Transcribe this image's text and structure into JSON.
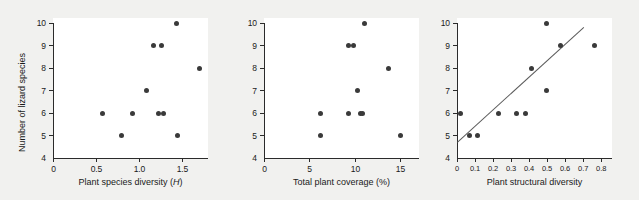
{
  "figure": {
    "background_color": "#f1f1ef",
    "panel_background_color": "#ffffff",
    "axis_color": "#2b2b2b",
    "point_color": "#3a3a3a",
    "line_color": "#5a5a5a",
    "shared_ylabel": "Number of lizard species"
  },
  "chart_data": [
    {
      "type": "scatter",
      "panel": 1,
      "title": "",
      "xlabel": "Plant species diversity (H)",
      "xlabel_italic_part": "H",
      "ylabel": "Number of lizard species",
      "xlim": [
        0,
        1.8
      ],
      "ylim": [
        4,
        10.3
      ],
      "grid": false,
      "legend": null,
      "xticks": [
        0,
        0.5,
        1.0,
        1.5
      ],
      "xticklabels": [
        "0",
        "0.5",
        "1.0",
        "1.5"
      ],
      "yticks": [
        4,
        5,
        6,
        7,
        8,
        9,
        10
      ],
      "yticklabels": [
        "4",
        "5",
        "6",
        "7",
        "8",
        "9",
        "10"
      ],
      "x": [
        0.58,
        0.8,
        0.92,
        1.09,
        1.17,
        1.22,
        1.26,
        1.28,
        1.43,
        1.45,
        1.7
      ],
      "y": [
        6,
        5,
        6,
        7,
        9,
        6,
        9,
        6,
        10,
        5,
        8
      ],
      "n_points": 11
    },
    {
      "type": "scatter",
      "panel": 2,
      "title": "",
      "xlabel": "Total plant coverage (%)",
      "ylabel": "Number of lizard species",
      "xlim": [
        0,
        17
      ],
      "ylim": [
        4,
        10.3
      ],
      "grid": false,
      "legend": null,
      "xticks": [
        0,
        5,
        10,
        15
      ],
      "xticklabels": [
        "0",
        "5",
        "10",
        "15"
      ],
      "yticks": [
        4,
        5,
        6,
        7,
        8,
        9,
        10
      ],
      "yticklabels": [
        "4",
        "5",
        "6",
        "7",
        "8",
        "9",
        "10"
      ],
      "x": [
        6.2,
        6.2,
        9.3,
        9.3,
        9.8,
        10.2,
        10.6,
        10.8,
        11.0,
        13.7,
        15.0
      ],
      "y": [
        6,
        5,
        9,
        6,
        9,
        7,
        6,
        6,
        10,
        8,
        5
      ],
      "n_points": 11
    },
    {
      "type": "scatter",
      "panel": 3,
      "title": "",
      "xlabel": "Plant structural diversity",
      "ylabel": "Number of lizard species",
      "xlim": [
        0,
        0.86
      ],
      "ylim": [
        4,
        10.3
      ],
      "grid": false,
      "legend": null,
      "xticks": [
        0,
        0.1,
        0.2,
        0.3,
        0.4,
        0.5,
        0.6,
        0.7,
        0.8
      ],
      "xticklabels": [
        "0",
        "0.1",
        "0.2",
        "0.3",
        "0.4",
        "0.5",
        "0.6",
        "0.7",
        "0.8"
      ],
      "yticks": [
        4,
        5,
        6,
        7,
        8,
        9,
        10
      ],
      "yticklabels": [
        "4",
        "5",
        "6",
        "7",
        "8",
        "9",
        "10"
      ],
      "x": [
        0.02,
        0.07,
        0.115,
        0.23,
        0.33,
        0.38,
        0.415,
        0.495,
        0.495,
        0.575,
        0.765
      ],
      "y": [
        6,
        5,
        5,
        6,
        6,
        6,
        8,
        10,
        7,
        9,
        9
      ],
      "n_points": 11,
      "fit_line": {
        "type": "line",
        "x0": 0.0,
        "y0": 4.7,
        "x1": 0.7,
        "y1": 9.8
      }
    }
  ]
}
